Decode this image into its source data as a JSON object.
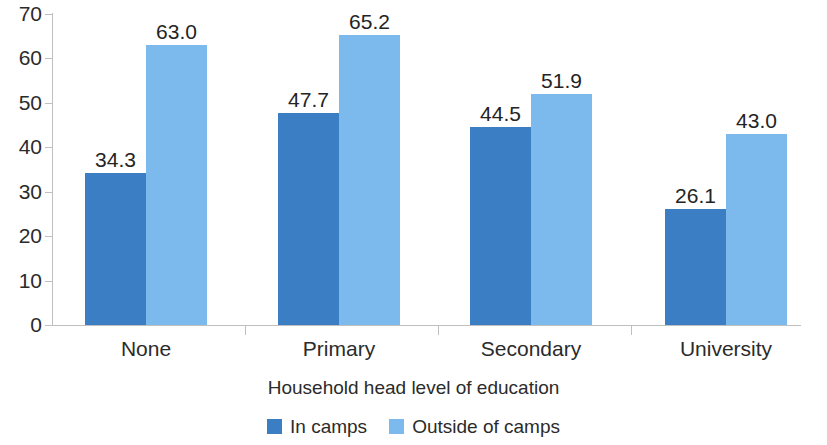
{
  "chart_data": {
    "type": "bar",
    "title": "",
    "xlabel": "Household head level of education",
    "ylabel": "",
    "categories": [
      "None",
      "Primary",
      "Secondary",
      "University"
    ],
    "series": [
      {
        "name": "In camps",
        "color": "#3c7ec4",
        "values": [
          34.3,
          47.7,
          44.5,
          26.1
        ],
        "labels": [
          "34.3",
          "47.7",
          "44.5",
          "26.1"
        ]
      },
      {
        "name": "Outside of camps",
        "color": "#7cb9ec",
        "values": [
          63.0,
          65.2,
          51.9,
          43.0
        ],
        "labels": [
          "63.0",
          "65.2",
          "51.9",
          "43.0"
        ]
      }
    ],
    "ylim": [
      0,
      70
    ],
    "yticks": [
      0,
      10,
      20,
      30,
      40,
      50,
      60,
      70
    ],
    "ytick_labels": [
      "0",
      "10",
      "20",
      "30",
      "40",
      "50",
      "60",
      "70"
    ],
    "grid": false,
    "legend_position": "bottom",
    "bar_group_mode": "grouped"
  },
  "legend": {
    "items": [
      {
        "label": "In camps",
        "color": "#3c7ec4"
      },
      {
        "label": "Outside of camps",
        "color": "#7cb9ec"
      }
    ]
  }
}
